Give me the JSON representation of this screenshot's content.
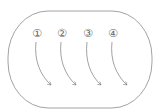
{
  "diagram": {
    "container": {
      "shape": "stadium",
      "stroke": "#8a8a8a"
    },
    "steps": [
      {
        "label": "①",
        "x": 37,
        "y": 33,
        "end_x": 51,
        "end_y": 85
      },
      {
        "label": "②",
        "x": 62,
        "y": 33,
        "end_x": 76,
        "end_y": 85
      },
      {
        "label": "③",
        "x": 88,
        "y": 33,
        "end_x": 101,
        "end_y": 85
      },
      {
        "label": "④",
        "x": 113,
        "y": 33,
        "end_x": 127,
        "end_y": 85
      }
    ],
    "arrow_color": "#7a7a7a"
  }
}
